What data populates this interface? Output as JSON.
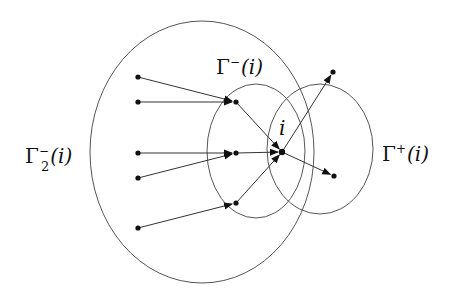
{
  "diagram": {
    "type": "directed-graph-neighborhoods",
    "colors": {
      "stroke": "#555555",
      "edge": "#333333",
      "node": "#111111",
      "background": "#ffffff"
    },
    "regions": [
      {
        "id": "gamma2-minus",
        "label_base": "Γ",
        "label_sup": "−",
        "label_sub": "2",
        "label_arg": "(i)",
        "cx": 202,
        "cy": 152,
        "rx": 112,
        "ry": 131,
        "label_x": 25,
        "label_y": 163
      },
      {
        "id": "gamma-minus",
        "label_base": "Γ",
        "label_sup": "−",
        "label_sub": "",
        "label_arg": "(i)",
        "cx": 256,
        "cy": 151,
        "rx": 49,
        "ry": 67,
        "label_x": 216,
        "label_y": 74
      },
      {
        "id": "gamma-plus",
        "label_base": "Γ",
        "label_sup": "+",
        "label_sub": "",
        "label_arg": "(i)",
        "cx": 320,
        "cy": 149,
        "rx": 53,
        "ry": 65,
        "label_x": 382,
        "label_y": 161
      }
    ],
    "center_node": {
      "id": "i",
      "label": "i",
      "x": 282,
      "y": 152,
      "label_x": 279,
      "label_y": 135
    },
    "nodes": [
      {
        "id": "a1",
        "x": 138,
        "y": 77
      },
      {
        "id": "a2",
        "x": 138,
        "y": 102
      },
      {
        "id": "a3",
        "x": 138,
        "y": 153
      },
      {
        "id": "a4",
        "x": 138,
        "y": 178
      },
      {
        "id": "a5",
        "x": 138,
        "y": 228
      },
      {
        "id": "b1",
        "x": 236,
        "y": 102
      },
      {
        "id": "b2",
        "x": 236,
        "y": 153
      },
      {
        "id": "b3",
        "x": 236,
        "y": 203
      },
      {
        "id": "c1",
        "x": 333,
        "y": 72
      },
      {
        "id": "c2",
        "x": 334,
        "y": 176
      }
    ],
    "edges": [
      {
        "from": "a1",
        "to": "b1"
      },
      {
        "from": "a2",
        "to": "b1"
      },
      {
        "from": "a3",
        "to": "b2"
      },
      {
        "from": "a4",
        "to": "b2"
      },
      {
        "from": "a5",
        "to": "b3"
      },
      {
        "from": "b1",
        "to": "i"
      },
      {
        "from": "b2",
        "to": "i"
      },
      {
        "from": "b3",
        "to": "i"
      },
      {
        "from": "i",
        "to": "c1"
      },
      {
        "from": "i",
        "to": "c2"
      }
    ]
  }
}
